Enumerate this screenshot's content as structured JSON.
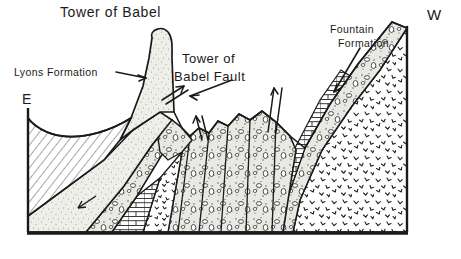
{
  "figure": {
    "type": "geologic-cross-section",
    "title_label": "Tower of Babel",
    "background_color": "#ffffff",
    "ink_color": "#1a1a1a"
  },
  "labels": {
    "title": "Tower of Babel",
    "lyons_formation": "Lyons Formation",
    "fault_line1": "Tower of",
    "fault_line2": "Babel Fault",
    "fountain_line1": "Fountain",
    "fountain_line2": "Formation",
    "direction_east": "E",
    "direction_west": "W"
  },
  "annotations": [
    {
      "name": "lyons-formation-pointer",
      "text": "Lyons Formation",
      "arrow": "points-right-to-spire"
    },
    {
      "name": "tower-of-babel-fault-pointer",
      "text": "Tower of Babel Fault",
      "arrow": "points-left-down-to-fault"
    },
    {
      "name": "fountain-formation-pointer",
      "text": "Fountain Formation",
      "arrow": "points-down-left-to-beds"
    },
    {
      "name": "fault-slip-pair-left",
      "text": "",
      "arrow": "opposed-slip-arrows"
    },
    {
      "name": "fault-slip-pair-center",
      "text": "",
      "arrow": "opposed-slip-arrows"
    },
    {
      "name": "fault-slip-pair-right",
      "text": "",
      "arrow": "opposed-slip-arrows"
    },
    {
      "name": "bedding-dip-arrow",
      "text": "",
      "arrow": "points-down-left"
    }
  ],
  "units": [
    {
      "name": "shale-hatched-unit",
      "pattern": "diagonal-hatch",
      "fill": "#ffffff"
    },
    {
      "name": "lyons-sandstone-unit",
      "pattern": "light-stipple",
      "fill": "#efefea"
    },
    {
      "name": "tower-of-babel-spire",
      "pattern": "light-stipple",
      "fill": "#efefea"
    },
    {
      "name": "conglomerate-unit",
      "pattern": "pebble-clasts",
      "fill": "#e8e8e2"
    },
    {
      "name": "limestone-brick-unit",
      "pattern": "brick",
      "fill": "#ffffff"
    },
    {
      "name": "granite-basement-unit",
      "pattern": "chevron-speckle",
      "fill": "#ffffff"
    },
    {
      "name": "fountain-formation-unit",
      "pattern": "pebble-clasts",
      "fill": "#e8e8e2"
    }
  ],
  "frame": {
    "baseline": "thick-horizontal-rule",
    "left_edge": "vertical-rule",
    "right_edge": "vertical-rule"
  }
}
